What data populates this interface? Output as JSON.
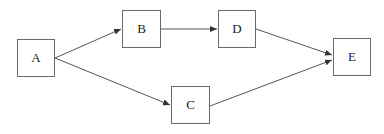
{
  "diagram": {
    "type": "directed-graph",
    "nodes": [
      {
        "id": "A",
        "label": "A",
        "x": 17,
        "y": 39,
        "w": 38,
        "h": 38
      },
      {
        "id": "B",
        "label": "B",
        "x": 122,
        "y": 10,
        "w": 39,
        "h": 38
      },
      {
        "id": "C",
        "label": "C",
        "x": 171,
        "y": 86,
        "w": 39,
        "h": 38
      },
      {
        "id": "D",
        "label": "D",
        "x": 218,
        "y": 10,
        "w": 38,
        "h": 38
      },
      {
        "id": "E",
        "label": "E",
        "x": 333,
        "y": 38,
        "w": 38,
        "h": 38
      }
    ],
    "edges": [
      {
        "from": "A",
        "to": "B"
      },
      {
        "from": "A",
        "to": "C"
      },
      {
        "from": "B",
        "to": "D"
      },
      {
        "from": "D",
        "to": "E"
      },
      {
        "from": "C",
        "to": "E"
      }
    ],
    "colors": {
      "stroke": "#555555",
      "box": "#6a6a6a",
      "text": "#222222"
    }
  }
}
